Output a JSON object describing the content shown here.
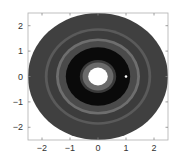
{
  "chart_data": {
    "type": "heatmap",
    "title": "",
    "xlabel": "",
    "ylabel": "",
    "xlim": [
      -2.5,
      2.5
    ],
    "ylim": [
      -2.5,
      2.5
    ],
    "xticks": [
      -2,
      -1,
      0,
      1,
      2
    ],
    "yticks": [
      -2,
      -1,
      0,
      1,
      2
    ],
    "xtick_labels": [
      "−2",
      "−1",
      "0",
      "1",
      "2"
    ],
    "ytick_labels": [
      "−2",
      "−1",
      "0",
      "1",
      "2"
    ],
    "grid": false,
    "legend": null,
    "rings": [
      {
        "r_inner": 0.0,
        "r_outer": 0.35,
        "color": "#ffffff"
      },
      {
        "r_inner": 0.35,
        "r_outer": 0.55,
        "color": "#6a6a6a"
      },
      {
        "r_inner": 0.55,
        "r_outer": 0.65,
        "color": "#3a3a3a"
      },
      {
        "r_inner": 0.65,
        "r_outer": 1.15,
        "color": "#0a0a0a"
      },
      {
        "r_inner": 1.15,
        "r_outer": 1.4,
        "color": "#4a4a4a"
      },
      {
        "r_inner": 1.4,
        "r_outer": 1.5,
        "color": "#6e6e6e"
      },
      {
        "r_inner": 1.5,
        "r_outer": 1.8,
        "color": "#3c3c3c"
      },
      {
        "r_inner": 1.8,
        "r_outer": 1.9,
        "color": "#5a5a5a"
      },
      {
        "r_inner": 1.9,
        "r_outer": 2.5,
        "color": "#404040"
      }
    ],
    "bright_spot": {
      "x": 1.0,
      "y": 0.0
    }
  }
}
